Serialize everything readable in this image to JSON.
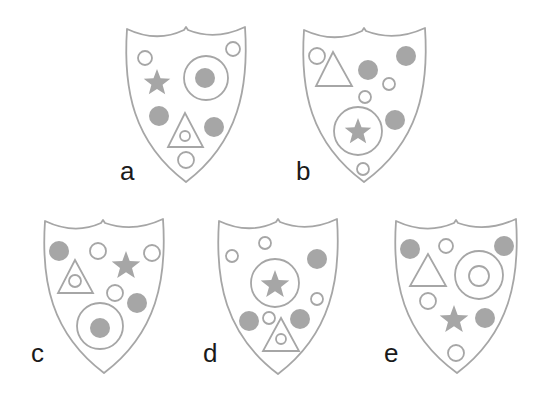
{
  "colors": {
    "stroke": "#a6a6a6",
    "fill": "#a6a6a6",
    "background": "#ffffff",
    "label": "#1a1a1a"
  },
  "shields": [
    {
      "id": "a",
      "label": "a",
      "label_pos": [
        120,
        180
      ],
      "outline": {
        "left": [
          127,
          29
        ],
        "dip": [
          186,
          34
        ],
        "right": [
          245,
          27
        ],
        "tip": [
          186,
          182
        ]
      },
      "elements": [
        {
          "type": "circle",
          "cx": 145,
          "cy": 58,
          "r": 7
        },
        {
          "type": "circle",
          "cx": 233,
          "cy": 49,
          "r": 7
        },
        {
          "type": "ring",
          "cx": 206,
          "cy": 78,
          "r": 22
        },
        {
          "type": "dot",
          "cx": 205,
          "cy": 78,
          "r": 10
        },
        {
          "type": "star",
          "cx": 157,
          "cy": 83,
          "r": 14
        },
        {
          "type": "dot",
          "cx": 159,
          "cy": 116,
          "r": 10
        },
        {
          "type": "triangle",
          "apex": [
            185,
            113
          ],
          "base_left": [
            168,
            147
          ],
          "base_right": [
            203,
            147
          ]
        },
        {
          "type": "circle",
          "cx": 185,
          "cy": 136,
          "r": 5
        },
        {
          "type": "dot",
          "cx": 214,
          "cy": 127,
          "r": 10
        },
        {
          "type": "circle",
          "cx": 186,
          "cy": 160,
          "r": 8
        }
      ]
    },
    {
      "id": "b",
      "label": "b",
      "label_pos": [
        296,
        180
      ],
      "outline": {
        "left": [
          304,
          30
        ],
        "dip": [
          364,
          35
        ],
        "right": [
          425,
          28
        ],
        "tip": [
          364,
          182
        ]
      },
      "elements": [
        {
          "type": "circle",
          "cx": 317,
          "cy": 56,
          "r": 8
        },
        {
          "type": "triangle",
          "apex": [
            333,
            52
          ],
          "base_left": [
            316,
            86
          ],
          "base_right": [
            352,
            86
          ]
        },
        {
          "type": "dot",
          "cx": 368,
          "cy": 70,
          "r": 10
        },
        {
          "type": "dot",
          "cx": 406,
          "cy": 56,
          "r": 10
        },
        {
          "type": "circle",
          "cx": 389,
          "cy": 84,
          "r": 6
        },
        {
          "type": "circle",
          "cx": 365,
          "cy": 97,
          "r": 6
        },
        {
          "type": "ring",
          "cx": 358,
          "cy": 131,
          "r": 24
        },
        {
          "type": "star",
          "cx": 358,
          "cy": 132,
          "r": 14
        },
        {
          "type": "dot",
          "cx": 395,
          "cy": 120,
          "r": 10
        },
        {
          "type": "circle",
          "cx": 363,
          "cy": 169,
          "r": 6
        }
      ]
    },
    {
      "id": "c",
      "label": "c",
      "label_pos": [
        31,
        362
      ],
      "outline": {
        "left": [
          45,
          221
        ],
        "dip": [
          103,
          227
        ],
        "right": [
          163,
          219
        ],
        "tip": [
          104,
          373
        ]
      },
      "elements": [
        {
          "type": "dot",
          "cx": 59,
          "cy": 251,
          "r": 10
        },
        {
          "type": "circle",
          "cx": 98,
          "cy": 251,
          "r": 8
        },
        {
          "type": "star",
          "cx": 126,
          "cy": 266,
          "r": 15
        },
        {
          "type": "circle",
          "cx": 152,
          "cy": 253,
          "r": 8
        },
        {
          "type": "triangle",
          "apex": [
            75,
            260
          ],
          "base_left": [
            58,
            293
          ],
          "base_right": [
            93,
            293
          ]
        },
        {
          "type": "circle",
          "cx": 75,
          "cy": 281,
          "r": 6
        },
        {
          "type": "circle",
          "cx": 115,
          "cy": 293,
          "r": 8
        },
        {
          "type": "dot",
          "cx": 137,
          "cy": 303,
          "r": 10
        },
        {
          "type": "ring",
          "cx": 100,
          "cy": 326,
          "r": 23
        },
        {
          "type": "dot",
          "cx": 100,
          "cy": 328,
          "r": 10
        }
      ]
    },
    {
      "id": "d",
      "label": "d",
      "label_pos": [
        203,
        362
      ],
      "outline": {
        "left": [
          219,
          221
        ],
        "dip": [
          278,
          226
        ],
        "right": [
          337,
          219
        ],
        "tip": [
          278,
          374
        ]
      },
      "elements": [
        {
          "type": "circle",
          "cx": 265,
          "cy": 243,
          "r": 6
        },
        {
          "type": "circle",
          "cx": 232,
          "cy": 256,
          "r": 6
        },
        {
          "type": "dot",
          "cx": 317,
          "cy": 259,
          "r": 10
        },
        {
          "type": "ring",
          "cx": 275,
          "cy": 283,
          "r": 24
        },
        {
          "type": "star",
          "cx": 275,
          "cy": 285,
          "r": 15
        },
        {
          "type": "circle",
          "cx": 317,
          "cy": 299,
          "r": 6
        },
        {
          "type": "dot",
          "cx": 249,
          "cy": 321,
          "r": 10
        },
        {
          "type": "circle",
          "cx": 269,
          "cy": 318,
          "r": 6
        },
        {
          "type": "dot",
          "cx": 300,
          "cy": 319,
          "r": 10
        },
        {
          "type": "triangle",
          "apex": [
            281,
            318
          ],
          "base_left": [
            263,
            351
          ],
          "base_right": [
            299,
            351
          ]
        },
        {
          "type": "circle",
          "cx": 281,
          "cy": 339,
          "r": 5
        }
      ]
    },
    {
      "id": "e",
      "label": "e",
      "label_pos": [
        384,
        362
      ],
      "outline": {
        "left": [
          396,
          221
        ],
        "dip": [
          456,
          227
        ],
        "right": [
          516,
          219
        ],
        "tip": [
          457,
          373
        ]
      },
      "elements": [
        {
          "type": "dot",
          "cx": 410,
          "cy": 249,
          "r": 10
        },
        {
          "type": "circle",
          "cx": 446,
          "cy": 246,
          "r": 7
        },
        {
          "type": "dot",
          "cx": 504,
          "cy": 246,
          "r": 10
        },
        {
          "type": "triangle",
          "apex": [
            428,
            254
          ],
          "base_left": [
            410,
            286
          ],
          "base_right": [
            446,
            286
          ]
        },
        {
          "type": "ring",
          "cx": 479,
          "cy": 275,
          "r": 24
        },
        {
          "type": "circle",
          "cx": 479,
          "cy": 276,
          "r": 10
        },
        {
          "type": "circle",
          "cx": 428,
          "cy": 301,
          "r": 8
        },
        {
          "type": "star",
          "cx": 454,
          "cy": 320,
          "r": 15
        },
        {
          "type": "dot",
          "cx": 485,
          "cy": 318,
          "r": 10
        },
        {
          "type": "circle",
          "cx": 456,
          "cy": 353,
          "r": 8
        }
      ]
    }
  ]
}
